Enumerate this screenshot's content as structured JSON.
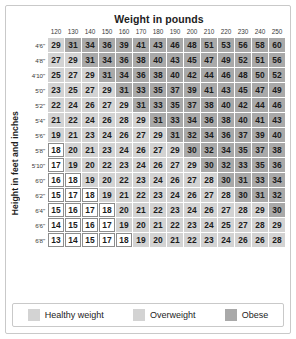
{
  "chart_title": "Weight in pounds",
  "y_axis_label": "Height in feet and inches",
  "colors": {
    "healthy": "#ffffff",
    "healthy_border": "#8d8d8d",
    "overweight": "#d3d3d3",
    "obese": "#a9a9a9",
    "frame": "#c9c9c9",
    "text": "#1b1b1b"
  },
  "legend": [
    {
      "label": "Healthy weight",
      "category": "healthy",
      "swatch": "#d3d3d3"
    },
    {
      "label": "Overweight",
      "category": "overweight",
      "swatch": "#d3d3d3"
    },
    {
      "label": "Obese",
      "category": "obese",
      "swatch": "#a9a9a9"
    }
  ],
  "chart_data": {
    "type": "heatmap",
    "title": "Weight in pounds",
    "xlabel": "Weight in pounds",
    "ylabel": "Height in feet and inches",
    "grid": true,
    "legend_position": "bottom",
    "categories": [
      "120",
      "130",
      "140",
      "150",
      "160",
      "170",
      "180",
      "190",
      "200",
      "210",
      "220",
      "230",
      "240",
      "250"
    ],
    "rows": [
      {
        "height": "4'6\"",
        "values": [
          29,
          31,
          34,
          36,
          39,
          41,
          43,
          46,
          48,
          51,
          53,
          56,
          58,
          60
        ],
        "cats": [
          "over",
          "obese",
          "obese",
          "obese",
          "obese",
          "obese",
          "obese",
          "obese",
          "obese",
          "obese",
          "obese",
          "obese",
          "obese",
          "obese"
        ]
      },
      {
        "height": "4'8\"",
        "values": [
          27,
          29,
          31,
          34,
          36,
          38,
          40,
          43,
          45,
          47,
          49,
          52,
          51,
          56
        ],
        "cats": [
          "over",
          "over",
          "obese",
          "obese",
          "obese",
          "obese",
          "obese",
          "obese",
          "obese",
          "obese",
          "obese",
          "obese",
          "obese",
          "obese"
        ]
      },
      {
        "height": "4'10\"",
        "values": [
          25,
          27,
          29,
          31,
          34,
          36,
          38,
          40,
          42,
          44,
          46,
          48,
          50,
          52
        ],
        "cats": [
          "over",
          "over",
          "over",
          "obese",
          "obese",
          "obese",
          "obese",
          "obese",
          "obese",
          "obese",
          "obese",
          "obese",
          "obese",
          "obese"
        ]
      },
      {
        "height": "5'0\"",
        "values": [
          23,
          25,
          27,
          29,
          31,
          33,
          35,
          37,
          39,
          41,
          43,
          45,
          47,
          49
        ],
        "cats": [
          "over",
          "over",
          "over",
          "over",
          "obese",
          "obese",
          "obese",
          "obese",
          "obese",
          "obese",
          "obese",
          "obese",
          "obese",
          "obese"
        ]
      },
      {
        "height": "5'2\"",
        "values": [
          22,
          24,
          26,
          27,
          29,
          31,
          33,
          35,
          37,
          38,
          40,
          42,
          44,
          46
        ],
        "cats": [
          "over",
          "over",
          "over",
          "over",
          "over",
          "obese",
          "obese",
          "obese",
          "obese",
          "obese",
          "obese",
          "obese",
          "obese",
          "obese"
        ]
      },
      {
        "height": "5'4\"",
        "values": [
          21,
          22,
          24,
          26,
          28,
          29,
          31,
          33,
          34,
          36,
          38,
          40,
          41,
          43
        ],
        "cats": [
          "over",
          "over",
          "over",
          "over",
          "over",
          "over",
          "obese",
          "obese",
          "obese",
          "obese",
          "obese",
          "obese",
          "obese",
          "obese"
        ]
      },
      {
        "height": "5'6\"",
        "values": [
          19,
          21,
          23,
          24,
          26,
          27,
          29,
          31,
          32,
          34,
          36,
          37,
          39,
          40
        ],
        "cats": [
          "over",
          "over",
          "over",
          "over",
          "over",
          "over",
          "over",
          "obese",
          "obese",
          "obese",
          "obese",
          "obese",
          "obese",
          "obese"
        ]
      },
      {
        "height": "5'8\"",
        "values": [
          18,
          20,
          21,
          23,
          24,
          26,
          27,
          29,
          30,
          32,
          34,
          35,
          37,
          38
        ],
        "cats": [
          "healthy",
          "over",
          "over",
          "over",
          "over",
          "over",
          "over",
          "over",
          "obese",
          "obese",
          "obese",
          "obese",
          "obese",
          "obese"
        ]
      },
      {
        "height": "5'10\"",
        "values": [
          17,
          19,
          20,
          22,
          23,
          24,
          26,
          27,
          29,
          30,
          32,
          33,
          35,
          36
        ],
        "cats": [
          "healthy",
          "over",
          "over",
          "over",
          "over",
          "over",
          "over",
          "over",
          "over",
          "obese",
          "obese",
          "obese",
          "obese",
          "obese"
        ]
      },
      {
        "height": "6'0\"",
        "values": [
          16,
          18,
          19,
          20,
          22,
          23,
          24,
          26,
          27,
          28,
          30,
          31,
          33,
          34
        ],
        "cats": [
          "healthy",
          "healthy",
          "over",
          "over",
          "over",
          "over",
          "over",
          "over",
          "over",
          "over",
          "obese",
          "obese",
          "obese",
          "obese"
        ]
      },
      {
        "height": "6'2\"",
        "values": [
          15,
          17,
          18,
          19,
          21,
          22,
          23,
          24,
          26,
          27,
          28,
          30,
          31,
          32
        ],
        "cats": [
          "healthy",
          "healthy",
          "healthy",
          "over",
          "over",
          "over",
          "over",
          "over",
          "over",
          "over",
          "over",
          "obese",
          "obese",
          "obese"
        ]
      },
      {
        "height": "6'4\"",
        "values": [
          15,
          16,
          17,
          18,
          20,
          21,
          22,
          23,
          24,
          26,
          27,
          28,
          29,
          30
        ],
        "cats": [
          "healthy",
          "healthy",
          "healthy",
          "healthy",
          "over",
          "over",
          "over",
          "over",
          "over",
          "over",
          "over",
          "over",
          "over",
          "obese"
        ]
      },
      {
        "height": "6'6\"",
        "values": [
          14,
          15,
          16,
          17,
          19,
          20,
          21,
          22,
          23,
          24,
          25,
          27,
          28,
          29
        ],
        "cats": [
          "healthy",
          "healthy",
          "healthy",
          "healthy",
          "over",
          "over",
          "over",
          "over",
          "over",
          "over",
          "over",
          "over",
          "over",
          "over"
        ]
      },
      {
        "height": "6'8\"",
        "values": [
          13,
          14,
          15,
          17,
          18,
          19,
          20,
          21,
          22,
          23,
          24,
          26,
          26,
          28
        ],
        "cats": [
          "healthy",
          "healthy",
          "healthy",
          "healthy",
          "healthy",
          "over",
          "over",
          "over",
          "over",
          "over",
          "over",
          "over",
          "over",
          "over"
        ]
      }
    ]
  }
}
